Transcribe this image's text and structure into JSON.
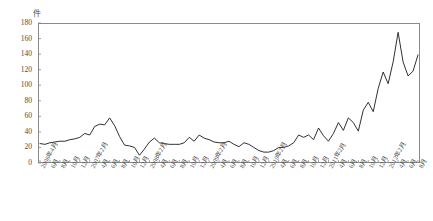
{
  "chart_data": {
    "type": "line",
    "title": "",
    "subtitle": "",
    "xlabel": "",
    "ylabel": "件",
    "unit_label": "件",
    "ylim": [
      0,
      180
    ],
    "ytick_values": [
      0,
      20,
      40,
      60,
      80,
      100,
      120,
      140,
      160,
      180
    ],
    "grid": false,
    "legend": null,
    "legend_position": "none",
    "line_color": "#1a1a1a",
    "axis_color": "#8a8a8a",
    "x_tick_every_months": 2,
    "x_start": "2006年4月",
    "x_end": "2012年8月",
    "x_tick_labels": [
      "2006年4月",
      "6月",
      "8月",
      "10月",
      "12月",
      "2007年2月",
      "4月",
      "6月",
      "8月",
      "10月",
      "12月",
      "2008年2月",
      "4月",
      "6月",
      "8月",
      "10月",
      "12月",
      "2009年2月",
      "4月",
      "6月",
      "8月",
      "10月",
      "12月",
      "2010年2月",
      "4月",
      "6月",
      "8月",
      "10月",
      "12月",
      "2011年2月",
      "4月",
      "6月",
      "8月",
      "10月",
      "12月",
      "2012年2月",
      "4月",
      "6月",
      "8月"
    ],
    "x": [
      "2006年4月",
      "2006年5月",
      "2006年6月",
      "2006年7月",
      "2006年8月",
      "2006年9月",
      "2006年10月",
      "2006年11月",
      "2006年12月",
      "2007年1月",
      "2007年2月",
      "2007年3月",
      "2007年4月",
      "2007年5月",
      "2007年6月",
      "2007年7月",
      "2007年8月",
      "2007年9月",
      "2007年10月",
      "2007年11月",
      "2007年12月",
      "2008年1月",
      "2008年2月",
      "2008年3月",
      "2008年4月",
      "2008年5月",
      "2008年6月",
      "2008年7月",
      "2008年8月",
      "2008年9月",
      "2008年10月",
      "2008年11月",
      "2008年12月",
      "2009年1月",
      "2009年2月",
      "2009年3月",
      "2009年4月",
      "2009年5月",
      "2009年6月",
      "2009年7月",
      "2009年8月",
      "2009年9月",
      "2009年10月",
      "2009年11月",
      "2009年12月",
      "2010年1月",
      "2010年2月",
      "2010年3月",
      "2010年4月",
      "2010年5月",
      "2010年6月",
      "2010年7月",
      "2010年8月",
      "2010年9月",
      "2010年10月",
      "2010年11月",
      "2010年12月",
      "2011年1月",
      "2011年2月",
      "2011年3月",
      "2011年4月",
      "2011年5月",
      "2011年6月",
      "2011年7月",
      "2011年8月",
      "2011年9月",
      "2011年10月",
      "2011年11月",
      "2011年12月",
      "2012年1月",
      "2012年2月",
      "2012年3月",
      "2012年4月",
      "2012年5月",
      "2012年6月",
      "2012年7月",
      "2012年8月"
    ],
    "values": [
      25,
      24,
      26,
      27,
      28,
      28,
      30,
      31,
      33,
      38,
      36,
      47,
      50,
      49,
      58,
      48,
      34,
      23,
      22,
      20,
      10,
      18,
      27,
      32,
      26,
      25,
      24,
      24,
      24,
      26,
      33,
      28,
      36,
      32,
      30,
      27,
      26,
      26,
      28,
      24,
      21,
      26,
      24,
      20,
      16,
      14,
      14,
      16,
      20,
      20,
      22,
      26,
      36,
      33,
      36,
      30,
      45,
      35,
      28,
      38,
      52,
      42,
      58,
      52,
      41,
      68,
      78,
      66,
      96,
      117,
      102,
      130,
      168,
      130,
      112,
      118,
      139
    ]
  }
}
